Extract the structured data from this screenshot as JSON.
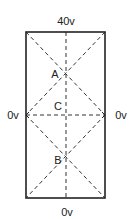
{
  "diagram": {
    "title": "",
    "region": "rectangle",
    "boundary_labels": {
      "top": "40v",
      "left": "0v",
      "right": "0v",
      "bottom": "0v"
    },
    "points": [
      {
        "id": "A",
        "label": "A"
      },
      {
        "id": "C",
        "label": "C"
      },
      {
        "id": "B",
        "label": "B"
      }
    ],
    "lines": [
      {
        "from": "top-left corner",
        "to": "right midpoint",
        "style": "dashed"
      },
      {
        "from": "top-right corner",
        "to": "left midpoint",
        "style": "dashed"
      },
      {
        "from": "left midpoint",
        "to": "bottom-right corner",
        "style": "dashed"
      },
      {
        "from": "right midpoint",
        "to": "bottom-left corner",
        "style": "dashed"
      },
      {
        "from": "top midpoint",
        "to": "bottom midpoint",
        "style": "dashed"
      },
      {
        "from": "left midpoint",
        "to": "right midpoint",
        "style": "dashed"
      }
    ]
  }
}
